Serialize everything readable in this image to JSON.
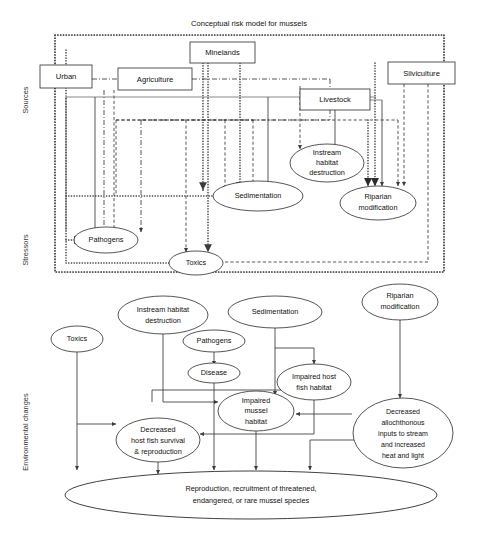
{
  "figure": {
    "title": "Conceptual risk model for mussels",
    "axis_labels": {
      "top": "Sources",
      "middle": "Stressors",
      "bottom": "Environmental changes"
    }
  },
  "sources": [
    {
      "id": "urban",
      "label": "Urban"
    },
    {
      "id": "agriculture",
      "label": "Agriculture"
    },
    {
      "id": "minelands",
      "label": "Minelands"
    },
    {
      "id": "livestock",
      "label": "Livestock"
    },
    {
      "id": "silviculture",
      "label": "Silviculture"
    }
  ],
  "stressors": [
    {
      "id": "pathogens",
      "label": "Pathogens"
    },
    {
      "id": "toxics",
      "label": "Toxics"
    },
    {
      "id": "sedimentation",
      "label": "Sedimentation"
    },
    {
      "id": "instream-habitat-destruction",
      "line1": "Instream",
      "line2": "habitat",
      "line3": "destruction"
    },
    {
      "id": "riparian-modification",
      "line1": "Riparian",
      "line2": "modification"
    }
  ],
  "environmental_changes": [
    {
      "id": "toxics-lower",
      "label": "Toxics"
    },
    {
      "id": "instream-habitat-destruction-lower",
      "line1": "Instream habitat",
      "line2": "destruction"
    },
    {
      "id": "sedimentation-lower",
      "label": "Sedimentation"
    },
    {
      "id": "riparian-modification-lower",
      "line1": "Riparian",
      "line2": "modification"
    },
    {
      "id": "pathogens-lower",
      "label": "Pathogens"
    },
    {
      "id": "disease",
      "label": "Disease"
    },
    {
      "id": "impaired-host-fish-habitat",
      "line1": "Impaired host",
      "line2": "fish habitat"
    },
    {
      "id": "impaired-mussel-habitat",
      "line1": "Impaired",
      "line2": "mussel",
      "line3": "habitat"
    },
    {
      "id": "decreased-host-fish-survival",
      "line1": "Decreased",
      "line2": "host fish survival",
      "line3": "& reproduction"
    },
    {
      "id": "decreased-allochthonous-inputs",
      "line1": "Decreased",
      "line2": "allochthonous",
      "line3": "inputs to stream",
      "line4": "and increased",
      "line5": "heat and light"
    }
  ],
  "endpoint": {
    "id": "mussel-endpoint",
    "line1": "Reproduction, recruitment of threatened,",
    "line2": "endangered, or rare mussel species"
  },
  "colors": {
    "stroke": "#2b2b2b",
    "line": "#3a3a3a",
    "background": "#ffffff"
  }
}
